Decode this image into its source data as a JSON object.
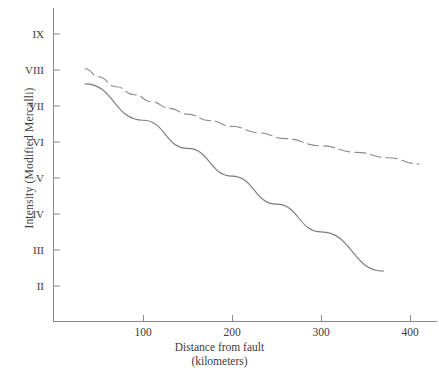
{
  "chart_data": {
    "type": "line",
    "title": "",
    "xlabel": "Distance from fault",
    "xlabel_units": "(kilometers)",
    "ylabel": "Intensity (Modified Mercalli)",
    "xlim": [
      30,
      437
    ],
    "ylim": [
      1.3,
      9.6
    ],
    "grid": false,
    "legend": "none",
    "x_ticks": [
      100,
      200,
      300,
      400
    ],
    "x_tick_labels": [
      "100",
      "200",
      "300",
      "400"
    ],
    "y_ticks": [
      2,
      3,
      4,
      5,
      6,
      7,
      8,
      9
    ],
    "y_tick_labels": [
      "II",
      "III",
      "IV",
      "V",
      "VI",
      "VII",
      "VIII",
      "IX"
    ],
    "series": [
      {
        "name": "upper-curve",
        "style": "dashed",
        "color": "#8c8c8c",
        "x": [
          35,
          50,
          70,
          90,
          110,
          130,
          150,
          175,
          200,
          230,
          260,
          300,
          340,
          375,
          410
        ],
        "y": [
          8.02,
          7.8,
          7.52,
          7.3,
          7.1,
          6.92,
          6.76,
          6.58,
          6.42,
          6.24,
          6.08,
          5.88,
          5.7,
          5.55,
          5.38
        ]
      },
      {
        "name": "lower-line",
        "style": "solid",
        "color": "#7d7d7d",
        "x": [
          35,
          100,
          150,
          200,
          250,
          300,
          370
        ],
        "y": [
          7.6,
          6.59,
          5.81,
          5.04,
          4.26,
          3.49,
          2.4
        ]
      }
    ]
  },
  "caption": {
    "partial_text_bottom": ""
  }
}
